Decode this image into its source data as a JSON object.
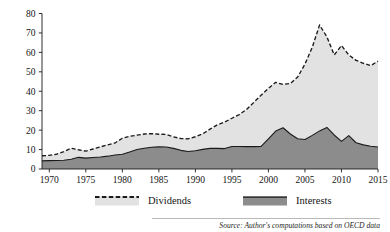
{
  "figure": {
    "background_color": "#ffffff",
    "source_note": "Source: Author's computations based on OECD data"
  },
  "legend": {
    "position": "below-axes",
    "entries": [
      {
        "label": "Dividends",
        "fill_color": "#e2e2e2",
        "line_style": "dashed",
        "line_color": "#1a1a1a"
      },
      {
        "label": "Interests",
        "fill_color": "#8c8c8c",
        "line_style": "solid",
        "line_color": "#1a1a1a"
      }
    ]
  },
  "chart_data": {
    "type": "area",
    "stacked": true,
    "title": "",
    "subtitle": "",
    "xlabel": "",
    "ylabel": "",
    "xlim": [
      1969,
      2015
    ],
    "ylim": [
      0,
      80
    ],
    "grid": false,
    "xticks": [
      1970,
      1975,
      1980,
      1985,
      1990,
      1995,
      2000,
      2005,
      2010,
      2015
    ],
    "xtick_labels": [
      "1970",
      "1975",
      "1980",
      "1985",
      "1990",
      "1995",
      "2000",
      "2005",
      "2010",
      "2015"
    ],
    "yticks": [
      0,
      10,
      20,
      30,
      40,
      50,
      60,
      70,
      80
    ],
    "ytick_labels": [
      "0",
      "10",
      "20",
      "30",
      "40",
      "50",
      "60",
      "70",
      "80"
    ],
    "x": [
      1969,
      1970,
      1971,
      1972,
      1973,
      1974,
      1975,
      1976,
      1977,
      1978,
      1979,
      1980,
      1981,
      1982,
      1983,
      1984,
      1985,
      1986,
      1987,
      1988,
      1989,
      1990,
      1991,
      1992,
      1993,
      1994,
      1995,
      1996,
      1997,
      1998,
      1999,
      2000,
      2001,
      2002,
      2003,
      2004,
      2005,
      2006,
      2007,
      2008,
      2009,
      2010,
      2011,
      2012,
      2013,
      2014,
      2015
    ],
    "series": [
      {
        "name": "Interests",
        "fill_color": "#8c8c8c",
        "line_color": "#1a1a1a",
        "line_style": "solid",
        "values": [
          4.2,
          4.3,
          4.4,
          4.5,
          5.0,
          6.0,
          5.6,
          5.9,
          6.2,
          6.6,
          7.2,
          7.6,
          8.8,
          10.0,
          10.7,
          11.2,
          11.4,
          11.3,
          10.6,
          9.6,
          9.0,
          9.4,
          10.1,
          10.6,
          10.6,
          10.5,
          11.6,
          11.6,
          11.5,
          11.5,
          11.6,
          15.5,
          19.5,
          21.2,
          18.0,
          15.6,
          15.2,
          17.3,
          19.6,
          21.4,
          17.5,
          14.2,
          17.2,
          13.5,
          12.4,
          11.7,
          11.3
        ]
      },
      {
        "name": "Dividends",
        "fill_color": "#e2e2e2",
        "line_color": "#1a1a1a",
        "line_style": "dashed",
        "values": [
          2.6,
          2.7,
          3.2,
          4.4,
          5.7,
          3.9,
          3.6,
          4.4,
          5.2,
          5.8,
          6.2,
          8.2,
          8.0,
          7.4,
          7.3,
          7.0,
          6.5,
          6.5,
          5.9,
          6.1,
          6.5,
          7.2,
          8.0,
          9.9,
          12.1,
          13.6,
          14.5,
          16.4,
          19.1,
          22.8,
          26.4,
          26.0,
          25.1,
          22.3,
          26.0,
          31.7,
          38.8,
          45.3,
          54.5,
          46.6,
          41.2,
          49.3,
          41.5,
          42.4,
          42.0,
          41.5,
          44.2
        ]
      }
    ],
    "totals": [
      6.8,
      7.0,
      7.6,
      8.9,
      10.7,
      9.9,
      9.2,
      10.3,
      11.4,
      12.4,
      13.4,
      15.8,
      16.8,
      17.4,
      18.0,
      18.2,
      17.9,
      17.8,
      16.5,
      15.7,
      15.5,
      16.6,
      18.1,
      20.5,
      22.7,
      24.1,
      26.1,
      28.0,
      30.6,
      34.3,
      38.0,
      41.5,
      44.6,
      43.5,
      44.0,
      47.3,
      54.0,
      62.6,
      74.1,
      68.0,
      58.7,
      63.5,
      58.7,
      55.9,
      54.4,
      53.2,
      55.5
    ]
  }
}
